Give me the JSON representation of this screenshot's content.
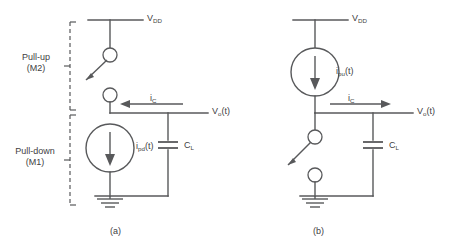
{
  "figure": {
    "title_left_caption": "(a)",
    "title_right_caption": "(b)"
  },
  "brackets": {
    "pullup": {
      "line1": "Pull-up",
      "line2": "(M2)"
    },
    "pulldown": {
      "line1": "Pull-down",
      "line2": "(M1)"
    }
  },
  "circuit_a": {
    "supply_label": "V",
    "supply_sub": "DD",
    "cap_current_label": "i",
    "cap_current_sub": "C",
    "source_label": "i",
    "source_sub": "pd",
    "source_suffix": "(t)",
    "cap_label": "C",
    "cap_sub": "L",
    "output_label": "V",
    "output_sub": "o",
    "output_suffix": "(t)",
    "current_direction": "left",
    "source_arrow": "down",
    "switch_state": "open",
    "switch_position": "pull-up"
  },
  "circuit_b": {
    "supply_label": "V",
    "supply_sub": "DD",
    "cap_current_label": "i",
    "cap_current_sub": "C",
    "source_label": "i",
    "source_sub": "pu",
    "source_suffix": "(t)",
    "cap_label": "C",
    "cap_sub": "L",
    "output_label": "V",
    "output_sub": "o",
    "output_suffix": "(t)",
    "current_direction": "right",
    "source_arrow": "down",
    "switch_state": "open",
    "switch_position": "pull-down"
  },
  "colors": {
    "line": "#58595b",
    "text": "#414042",
    "background": "#ffffff"
  }
}
